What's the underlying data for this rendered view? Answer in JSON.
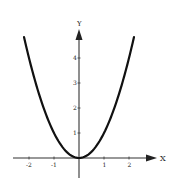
{
  "chart_data": {
    "type": "line",
    "title": "",
    "function": "y = x^2",
    "xlabel": "X",
    "ylabel": "Y",
    "xlim": [
      -2.2,
      2.2
    ],
    "ylim": [
      0,
      4.84
    ],
    "x_ticks": [
      -2,
      -1,
      1,
      2
    ],
    "x_tick_labels": [
      "-2",
      "-1",
      "1",
      "2"
    ],
    "y_ticks": [
      1,
      2,
      3,
      4
    ],
    "y_tick_labels": [
      "1",
      "2",
      "3",
      "4"
    ],
    "grid": false,
    "legend": null,
    "series": [
      {
        "name": "parabola",
        "x": [
          -2.2,
          -2,
          -1.5,
          -1,
          -0.5,
          0,
          0.5,
          1,
          1.5,
          2,
          2.2
        ],
        "values": [
          4.84,
          4,
          2.25,
          1,
          0.25,
          0,
          0.25,
          1,
          2.25,
          4,
          4.84
        ]
      }
    ]
  },
  "colors": {
    "curve": "#111111",
    "axis": "#333333",
    "background": "#ffffff"
  }
}
